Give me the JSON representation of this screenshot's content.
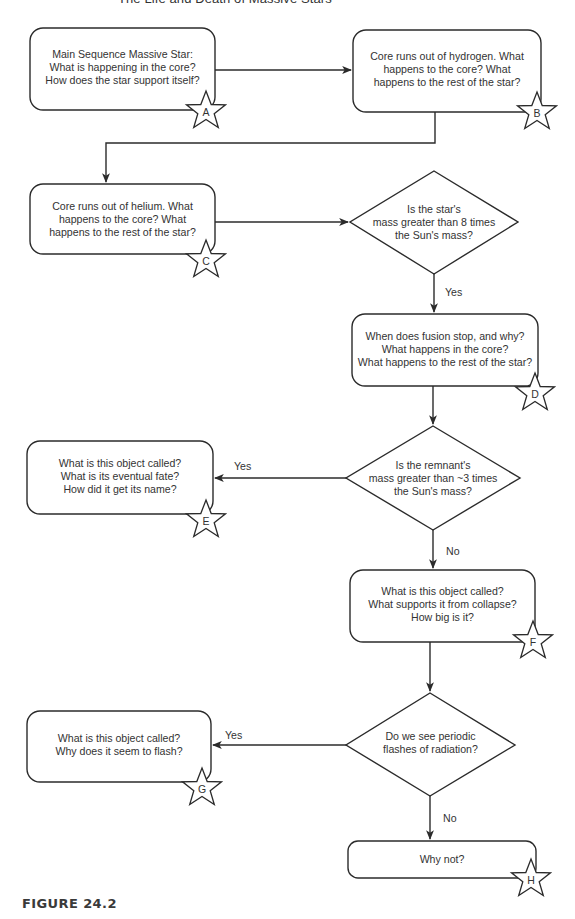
{
  "header": {
    "title": "The Life and Death of Massive Stars"
  },
  "nodes": {
    "A": {
      "label": "A",
      "lines": [
        "Main Sequence Massive Star:",
        "What is happening in the core?",
        "How does the star support itself?"
      ]
    },
    "B": {
      "label": "B",
      "lines": [
        "Core runs out of hydrogen. What",
        "happens to the core? What",
        "happens to the rest of the star?"
      ]
    },
    "C": {
      "label": "C",
      "lines": [
        "Core runs out of helium. What",
        "happens to the core? What",
        "happens to the rest of the star?"
      ]
    },
    "D": {
      "label": "D",
      "lines": [
        "When does fusion stop, and why?",
        "What happens in the core?",
        "What happens to the rest of the star?"
      ]
    },
    "E": {
      "label": "E",
      "lines": [
        "What is this object called?",
        "What is its eventual fate?",
        "How did it get its name?"
      ]
    },
    "F": {
      "label": "F",
      "lines": [
        "What is this object called?",
        "What supports it from collapse?",
        "How big is it?"
      ]
    },
    "G": {
      "label": "G",
      "lines": [
        "What is this object called?",
        "Why does it seem to flash?"
      ]
    },
    "H": {
      "label": "H",
      "lines": [
        "Why not?"
      ]
    }
  },
  "decisions": {
    "d1": {
      "lines": [
        "Is the star's",
        "mass greater than 8 times",
        "the Sun's mass?"
      ],
      "yes_label": "Yes"
    },
    "d2": {
      "lines": [
        "Is the remnant's",
        "mass greater than ~3 times",
        "the Sun's mass?"
      ],
      "yes_label": "Yes",
      "no_label": "No"
    },
    "d3": {
      "lines": [
        "Do we see periodic",
        "flashes of radiation?"
      ],
      "yes_label": "Yes",
      "no_label": "No"
    }
  },
  "caption": "FIGURE 24.2",
  "colors": {
    "stroke": "#2b2b2b",
    "text": "#333333",
    "background": "#ffffff"
  }
}
